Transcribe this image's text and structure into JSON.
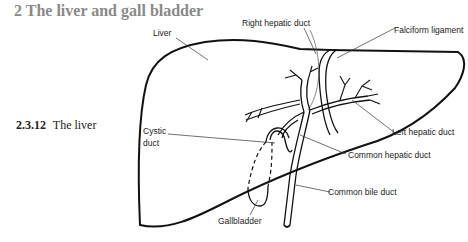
{
  "heading": "2 The liver and gall bladder",
  "caption": {
    "number": "2.3.12",
    "title": "The liver"
  },
  "labels": {
    "liver": "Liver",
    "right_hepatic_duct": "Right hepatic duct",
    "falciform_ligament": "Falciform ligament",
    "left_hepatic_duct": "Left hepatic duct",
    "cystic_duct_1": "Cystic",
    "cystic_duct_2": "duct",
    "common_hepatic_duct": "Common hepatic duct",
    "common_bile_duct": "Common bile duct",
    "gallbladder": "Gallbladder"
  }
}
